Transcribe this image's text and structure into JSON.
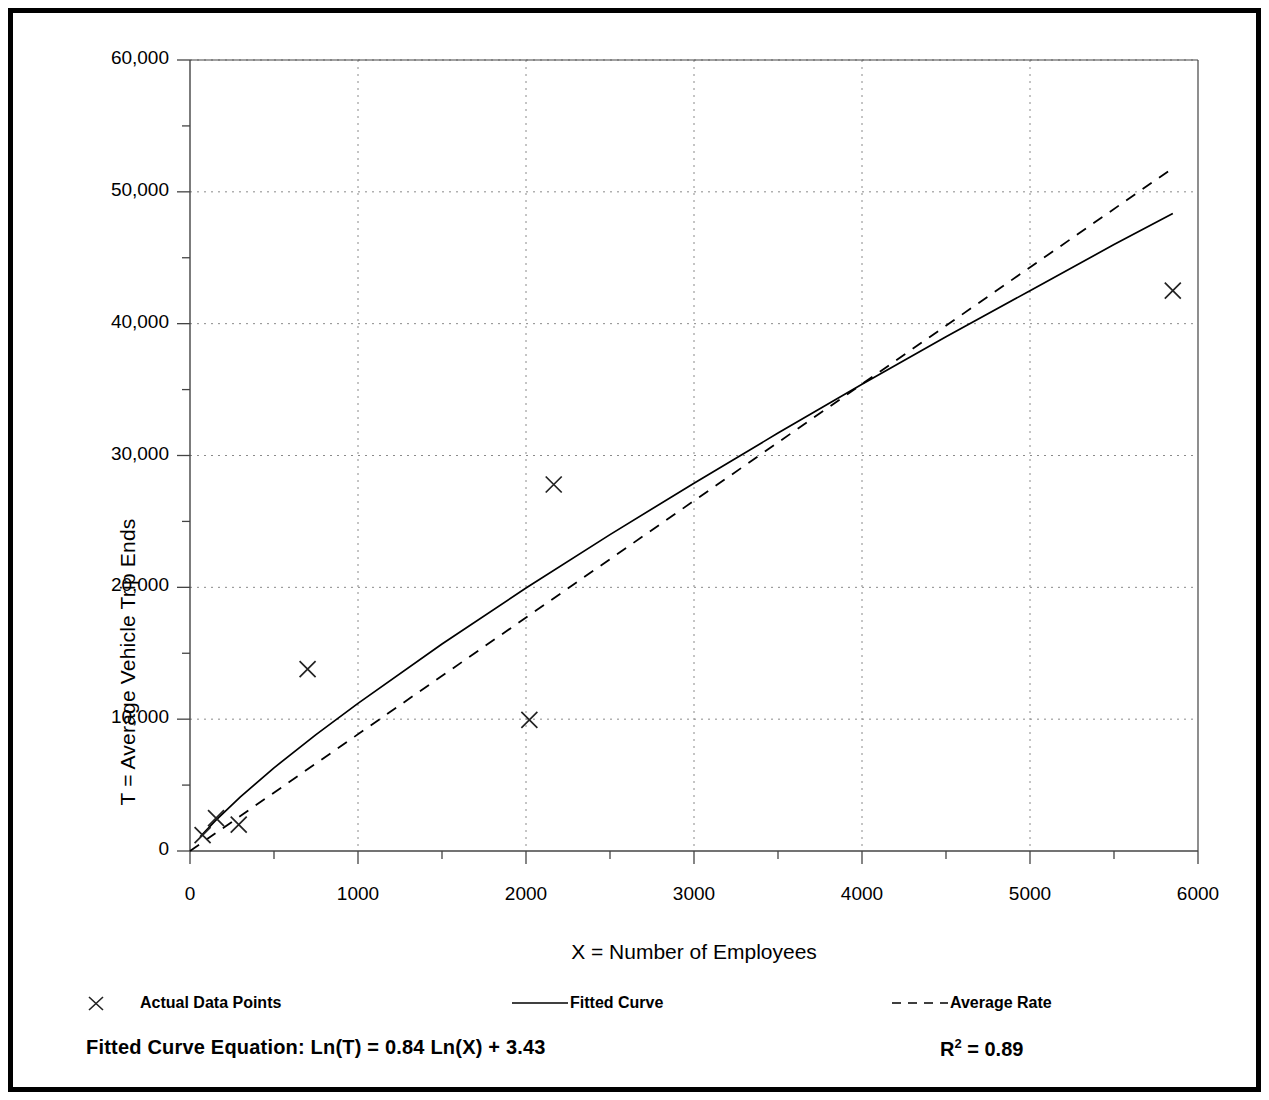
{
  "chart_data": {
    "type": "scatter",
    "title": "",
    "xlabel": "X = Number of Employees",
    "ylabel": "T = Average Vehicle Trip Ends",
    "xlim": [
      0,
      6000
    ],
    "ylim": [
      0,
      60000
    ],
    "x_ticks": [
      "0",
      "1000",
      "2000",
      "3000",
      "4000",
      "5000",
      "6000"
    ],
    "x_tick_values": [
      0,
      1000,
      2000,
      3000,
      4000,
      5000,
      6000
    ],
    "x_minor_step": 500,
    "y_ticks": [
      "0",
      "10,000",
      "20,000",
      "30,000",
      "40,000",
      "50,000",
      "60,000"
    ],
    "y_tick_values": [
      0,
      10000,
      20000,
      30000,
      40000,
      50000,
      60000
    ],
    "y_minor_step": 5000,
    "grid": "dotted major gridlines on both axes",
    "legend_position": "below-plot",
    "series": [
      {
        "name": "Actual Data Points",
        "type": "scatter",
        "marker": "x",
        "points": [
          {
            "x": 75,
            "y": 1200
          },
          {
            "x": 155,
            "y": 2500
          },
          {
            "x": 290,
            "y": 2000
          },
          {
            "x": 700,
            "y": 13800
          },
          {
            "x": 2020,
            "y": 9950
          },
          {
            "x": 2165,
            "y": 27800
          },
          {
            "x": 5850,
            "y": 42500
          }
        ]
      },
      {
        "name": "Fitted Curve",
        "type": "line",
        "style": "solid",
        "equation": "T = exp(3.43) * X^0.84",
        "coef_a": 0.84,
        "coef_b": 3.43,
        "points": [
          {
            "x": 60,
            "y": 1070
          },
          {
            "x": 150,
            "y": 2290
          },
          {
            "x": 300,
            "y": 4100
          },
          {
            "x": 500,
            "y": 6310
          },
          {
            "x": 750,
            "y": 8830
          },
          {
            "x": 1000,
            "y": 11200
          },
          {
            "x": 1500,
            "y": 15700
          },
          {
            "x": 2000,
            "y": 19950
          },
          {
            "x": 2500,
            "y": 24000
          },
          {
            "x": 3000,
            "y": 27900
          },
          {
            "x": 3500,
            "y": 31700
          },
          {
            "x": 4000,
            "y": 35400
          },
          {
            "x": 4500,
            "y": 39000
          },
          {
            "x": 5000,
            "y": 42500
          },
          {
            "x": 5500,
            "y": 46000
          },
          {
            "x": 5850,
            "y": 48350
          }
        ]
      },
      {
        "name": "Average Rate",
        "type": "line",
        "style": "dashed",
        "slope": 8.9,
        "points": [
          {
            "x": 0,
            "y": 0
          },
          {
            "x": 5850,
            "y": 51800
          }
        ]
      }
    ],
    "annotations": [
      {
        "name": "fitted-curve-equation",
        "text": "Fitted Curve Equation:  Ln(T) = 0.84 Ln(X) + 3.43"
      },
      {
        "name": "r-squared",
        "text": "R2 = 0.89",
        "value": 0.89
      }
    ]
  },
  "axes": {
    "y_label": "T = Average Vehicle Trip Ends",
    "x_label": "X = Number of Employees"
  },
  "legend": {
    "items": [
      {
        "label": "Actual Data Points",
        "marker": "x-marker"
      },
      {
        "label": "Fitted Curve",
        "marker": "solid-line"
      },
      {
        "label": "Average Rate",
        "marker": "dashed-line"
      }
    ]
  },
  "footer": {
    "equation_label": "Fitted Curve Equation:",
    "equation_body": "Ln(T) = 0.84 Ln(X) + 3.43",
    "equation_full": "Fitted Curve Equation:  Ln(T) = 0.84 Ln(X) + 3.43",
    "r_base": "R",
    "r_exp": "2",
    "r_value": "= 0.89"
  },
  "colors": {
    "ink": "#000000",
    "grid": "#8a8a8a",
    "axis": "#444444",
    "background": "#ffffff"
  }
}
